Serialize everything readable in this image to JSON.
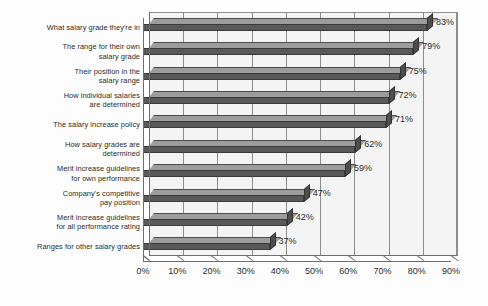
{
  "chart_data": {
    "type": "bar",
    "orientation": "horizontal",
    "title": "",
    "subtitle": "",
    "xlabel": "",
    "ylabel": "",
    "xlim": [
      0,
      90
    ],
    "grid": true,
    "legend": null,
    "value_suffix": "%",
    "categories": [
      "What salary grade they're in",
      "The range for their own\nsalary grade",
      "Their position in the\nsalary range",
      "How individual salaries\nare determined",
      "The salary increase policy",
      "How salary grades are\ndetermined",
      "Merit increase guidelines\nfor own performance",
      "Company's competitive\npay position",
      "Merit increase guidelines\nfor all performance rating",
      "Ranges for other salary grades"
    ],
    "values": [
      83,
      79,
      75,
      72,
      71,
      62,
      59,
      47,
      42,
      37
    ],
    "data_labels": [
      "83%",
      "79%",
      "75%",
      "72%",
      "71%",
      "62%",
      "59%",
      "47%",
      "42%",
      "37%"
    ],
    "xticks": [
      0,
      10,
      20,
      30,
      40,
      50,
      60,
      70,
      80,
      90
    ],
    "xticklabels": [
      "0%",
      "10%",
      "20%",
      "30%",
      "40%",
      "50%",
      "60%",
      "70%",
      "80%",
      "90%"
    ],
    "colors": {
      "bar_front": "#595959",
      "bar_top": "#9d9d9d",
      "bar_edge": "#3a3a3a",
      "plot_background": "#f4f4f4",
      "gridline": "#8d8d8d",
      "axis": "#6f6f6f",
      "text": "#2b2b2b",
      "page_background": "#fdfdfd"
    }
  }
}
